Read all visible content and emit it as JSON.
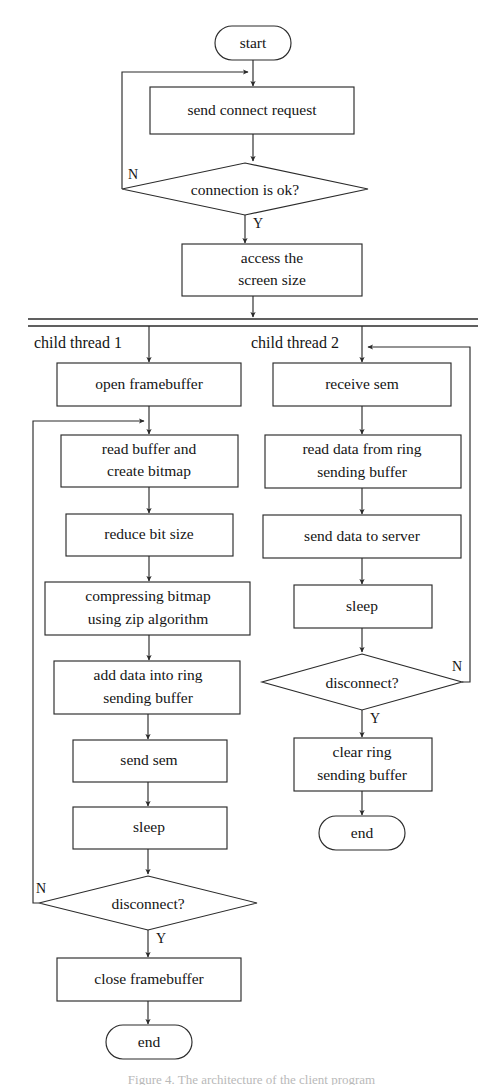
{
  "figure": {
    "type": "flowchart",
    "caption": "Figure 4.   The architecture of the client program",
    "stroke_color": "#2b2b2b",
    "fill_color": "#ffffff",
    "text_color": "#141414",
    "background": "#ffffff"
  },
  "main": {
    "start_label": "start",
    "nodes": [
      {
        "id": "start",
        "kind": "oval",
        "label": "start"
      },
      {
        "id": "send-connect-request",
        "kind": "process",
        "label": "send connect request"
      },
      {
        "id": "connection-is-ok",
        "kind": "decision",
        "label": "connection is ok?"
      },
      {
        "id": "access-screen-size",
        "kind": "process",
        "label_line1": "access the",
        "label_line2": "screen size"
      }
    ],
    "branch_no": "N",
    "branch_yes": "Y"
  },
  "fork": {
    "name": "fork-bar",
    "thread1_label": "child thread 1",
    "thread2_label": "child thread 2"
  },
  "thread1": {
    "label": "child thread 1",
    "nodes": [
      {
        "id": "open-framebuffer",
        "kind": "process",
        "label_line1": "open framebuffer",
        "label_line2": ""
      },
      {
        "id": "read-buffer-create-bitmap",
        "kind": "process",
        "label_line1": "read buffer and",
        "label_line2": "create bitmap"
      },
      {
        "id": "reduce-bit-size",
        "kind": "process",
        "label_line1": "reduce bit size",
        "label_line2": ""
      },
      {
        "id": "compressing-bitmap",
        "kind": "process",
        "label_line1": "compressing bitmap",
        "label_line2": "using zip algorithm"
      },
      {
        "id": "add-data-into-ring-sending-buffer",
        "kind": "process",
        "label_line1": "add data into ring",
        "label_line2": "sending buffer"
      },
      {
        "id": "send-sem",
        "kind": "process",
        "label_line1": "send sem",
        "label_line2": ""
      },
      {
        "id": "sleep",
        "kind": "process",
        "label_line1": "sleep",
        "label_line2": ""
      },
      {
        "id": "disconnect",
        "kind": "decision",
        "label_line1": "disconnect?",
        "label_line2": ""
      },
      {
        "id": "close-framebuffer",
        "kind": "process",
        "label_line1": "close framebuffer",
        "label_line2": ""
      },
      {
        "id": "end",
        "kind": "oval",
        "label_line1": "end",
        "label_line2": ""
      }
    ],
    "branch_no": "N",
    "branch_yes": "Y"
  },
  "thread2": {
    "label": "child thread 2",
    "nodes": [
      {
        "id": "receive-sem",
        "kind": "process",
        "label_line1": "receive sem",
        "label_line2": ""
      },
      {
        "id": "read-data-from-ring-sending-buffer",
        "kind": "process",
        "label_line1": "read data from ring",
        "label_line2": "sending buffer"
      },
      {
        "id": "send-data-to-server",
        "kind": "process",
        "label_line1": "send data to server",
        "label_line2": ""
      },
      {
        "id": "sleep",
        "kind": "process",
        "label_line1": "sleep",
        "label_line2": ""
      },
      {
        "id": "disconnect",
        "kind": "decision",
        "label_line1": "disconnect?",
        "label_line2": ""
      },
      {
        "id": "clear-ring-sending-buffer",
        "kind": "process",
        "label_line1": "clear ring",
        "label_line2": "sending buffer"
      },
      {
        "id": "end",
        "kind": "oval",
        "label_line1": "end",
        "label_line2": ""
      }
    ],
    "branch_no": "N",
    "branch_yes": "Y"
  }
}
